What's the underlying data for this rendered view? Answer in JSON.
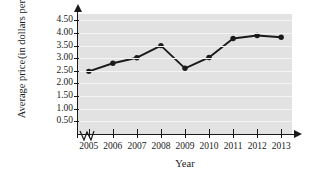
{
  "chart_data": {
    "type": "line",
    "title": "",
    "xlabel": "Year",
    "ylabel": "Average price (in dollars per gallon)",
    "ylabel_line1": "Average price",
    "ylabel_line2": "(in dollars per gallon)",
    "categories": [
      "2005",
      "2006",
      "2007",
      "2008",
      "2009",
      "2010",
      "2011",
      "2012",
      "2013"
    ],
    "x": [
      2005,
      2006,
      2007,
      2008,
      2009,
      2010,
      2011,
      2012,
      2013
    ],
    "values": [
      2.48,
      2.8,
      3.02,
      3.5,
      2.6,
      3.03,
      3.78,
      3.9,
      3.83
    ],
    "ytick_labels": [
      "0.50",
      "1.00",
      "1.50",
      "2.00",
      "2.50",
      "3.00",
      "3.50",
      "4.00",
      "4.50"
    ],
    "ytick_values": [
      0.5,
      1.0,
      1.5,
      2.0,
      2.5,
      3.0,
      3.5,
      4.0,
      4.5
    ],
    "ylim": [
      0,
      4.75
    ],
    "xlim": [
      2004.55,
      2013.45
    ],
    "grid": true,
    "legend": "none",
    "series": [
      {
        "name": "Average price",
        "values": [
          2.48,
          2.8,
          3.02,
          3.5,
          2.6,
          3.03,
          3.78,
          3.9,
          3.83
        ]
      }
    ],
    "axis_break_x": true,
    "marker": "filled-circle",
    "colors": {
      "line": "#1a1a1a",
      "marker": "#1a1a1a",
      "plot_background": "#e2e2e2",
      "gridline": "#f4f4f4",
      "axis": "#1a1a1a",
      "text": "#1a1a1a",
      "page_background": "#ffffff"
    }
  }
}
